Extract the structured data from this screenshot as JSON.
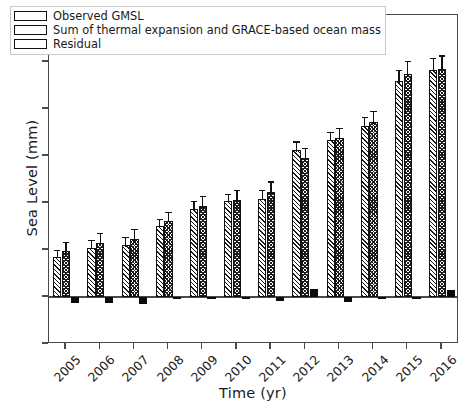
{
  "chart_data": {
    "type": "bar",
    "title": "",
    "xlabel": "Time (yr)",
    "ylabel": "Sea Level (mm)",
    "categories": [
      "2005",
      "2006",
      "2007",
      "2008",
      "2009",
      "2010",
      "2011",
      "2012",
      "2013",
      "2014",
      "2015",
      "2016"
    ],
    "ylim": [
      -10,
      60
    ],
    "yticks": [
      -10,
      0,
      10,
      20,
      30,
      40,
      50,
      60
    ],
    "ytick_labels": [
      "−10",
      "0",
      "10",
      "20",
      "30",
      "40",
      "50",
      "60"
    ],
    "grid": false,
    "legend_position": "upper left",
    "series": [
      {
        "name": "Observed GMSL",
        "pattern": "diagonal-hatch",
        "values": [
          8.5,
          10.5,
          11.0,
          15.2,
          18.7,
          20.4,
          20.9,
          31.2,
          33.5,
          36.3,
          46.0,
          48.3
        ],
        "errors": [
          1.6,
          1.7,
          1.7,
          1.5,
          1.7,
          1.6,
          1.8,
          1.9,
          1.7,
          2.0,
          2.3,
          2.6
        ]
      },
      {
        "name": "Sum of thermal expansion and GRACE-based ocean mass",
        "pattern": "cross-hatch",
        "values": [
          9.8,
          11.5,
          12.3,
          16.2,
          19.4,
          20.7,
          22.4,
          29.5,
          33.8,
          37.2,
          47.5,
          48.5
        ],
        "errors": [
          2.0,
          2.1,
          2.2,
          1.9,
          2.1,
          2.0,
          2.2,
          2.3,
          2.2,
          2.4,
          2.7,
          2.9
        ]
      },
      {
        "name": "Residual",
        "pattern": "solid-black",
        "values": [
          -1.3,
          -1.2,
          -1.4,
          -0.3,
          -0.2,
          -0.2,
          -0.9,
          1.8,
          -1.1,
          -0.4,
          -0.4,
          1.5
        ],
        "errors": [
          0,
          0,
          0,
          0,
          0,
          0,
          0,
          0,
          0,
          0,
          0,
          0
        ]
      }
    ]
  },
  "legend": {
    "items": [
      {
        "label": "Observed GMSL"
      },
      {
        "label": "Sum of thermal expansion and GRACE-based ocean mass"
      },
      {
        "label": "Residual"
      }
    ]
  },
  "axes": {
    "ylabel": "Sea Level (mm)",
    "xlabel": "Time (yr)"
  }
}
